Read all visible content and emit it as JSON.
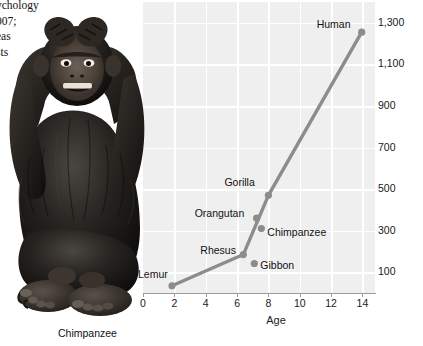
{
  "body_text": {
    "lines": [
      "ychology",
      "007;",
      "eas",
      "sts"
    ]
  },
  "photo": {
    "caption": "Chimpanzee",
    "alt_name": "seated chimpanzee with hands on head"
  },
  "chart_data": {
    "type": "line",
    "title": "",
    "xlabel": "Age",
    "ylabel": "",
    "xlim": [
      0,
      14.8
    ],
    "ylim": [
      0,
      1400
    ],
    "xticks": [
      0,
      2,
      4,
      6,
      8,
      10,
      12,
      14
    ],
    "xticklabels": [
      "0",
      "2",
      "4",
      "6",
      "8",
      "10",
      "12",
      "14"
    ],
    "yticks": [
      100,
      300,
      500,
      700,
      900,
      1100,
      1300
    ],
    "yticklabels": [
      "100",
      "300",
      "500",
      "700",
      "900",
      "1,100",
      "1,300"
    ],
    "grid": true,
    "legend": "none",
    "points": [
      {
        "name": "Lemur",
        "x": 1.85,
        "y": 35,
        "label_dx": -34,
        "label_dy": -12
      },
      {
        "name": "Rhesus",
        "x": 6.4,
        "y": 185,
        "label_dx": -43,
        "label_dy": -5
      },
      {
        "name": "Gibbon",
        "x": 7.1,
        "y": 142,
        "label_dx": 6,
        "label_dy": 2
      },
      {
        "name": "Orangutan",
        "x": 7.25,
        "y": 360,
        "label_dx": -62,
        "label_dy": -5
      },
      {
        "name": "Chimpanzee",
        "x": 7.55,
        "y": 310,
        "label_dx": 6,
        "label_dy": 3
      },
      {
        "name": "Gorilla",
        "x": 8.0,
        "y": 470,
        "label_dx": -44,
        "label_dy": -13
      },
      {
        "name": "Human",
        "x": 13.95,
        "y": 1255,
        "label_dx": -45,
        "label_dy": -8
      }
    ],
    "line_path_order": [
      "Lemur",
      "Rhesus",
      "Gorilla",
      "Human"
    ],
    "line_color": "#8c8c8c",
    "point_color": "#8c8c8c",
    "plot_bg": "#efefef",
    "grid_color": "#ffffff",
    "axis_color": "#9b9b9b"
  }
}
